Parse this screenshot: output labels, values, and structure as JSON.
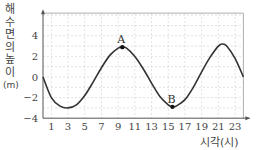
{
  "chart_data": {
    "type": "line",
    "title": "",
    "xlabel": "시각(시)",
    "ylabel": "해수면의 높이(m)",
    "xlim": [
      0,
      24
    ],
    "ylim": [
      -4,
      6
    ],
    "xticks": [
      1,
      3,
      5,
      7,
      9,
      11,
      13,
      15,
      17,
      19,
      21,
      23
    ],
    "yticks": [
      -4,
      -2,
      0,
      2,
      4
    ],
    "grid": true,
    "legend": null,
    "series": [
      {
        "name": "해수면의 높이",
        "x": [
          0,
          1,
          2,
          3,
          4,
          5,
          6,
          7,
          8,
          9,
          9.5,
          10,
          11,
          12,
          13,
          14,
          15,
          15.5,
          16,
          17,
          18,
          19,
          20,
          21,
          21.5,
          22,
          23,
          24
        ],
        "values": [
          0,
          -2.0,
          -2.8,
          -3.0,
          -2.7,
          -1.8,
          -0.5,
          0.9,
          2.1,
          2.8,
          2.9,
          2.8,
          2.0,
          0.8,
          -0.6,
          -1.9,
          -2.7,
          -2.9,
          -2.8,
          -2.2,
          -1.0,
          0.5,
          1.9,
          3.0,
          3.2,
          3.0,
          1.8,
          0
        ]
      }
    ],
    "annotations": [
      {
        "label": "A",
        "x": 9.5,
        "y": 2.9,
        "note": "high tide point"
      },
      {
        "label": "B",
        "x": 15.5,
        "y": -2.9,
        "note": "low tide point"
      }
    ]
  },
  "labels": {
    "ylabel_chars": [
      "해",
      "수",
      "면",
      "의",
      "높",
      "이",
      "(m)"
    ],
    "xlabel": "시각(시)",
    "point_a": "A",
    "point_b": "B"
  }
}
